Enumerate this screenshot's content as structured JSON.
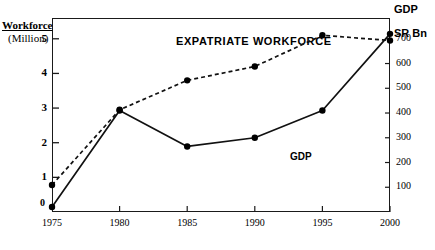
{
  "chart_data": {
    "type": "line",
    "title": "",
    "xlabel": "",
    "x": [
      1975,
      1980,
      1985,
      1990,
      1995,
      2000
    ],
    "categories": [
      "1975",
      "1980",
      "1985",
      "1990",
      "1995",
      "2000"
    ],
    "xlim": [
      1975,
      2000
    ],
    "grid": false,
    "legend_position": "inline-annotation",
    "axes": {
      "left": {
        "title": "Workforce",
        "unit": "(Million)",
        "ticks": [
          1,
          2,
          3,
          4,
          5
        ],
        "tick_labels": [
          "1",
          "2",
          "3",
          "4",
          "5"
        ],
        "zero_label": "0",
        "lim": [
          0,
          5.6
        ]
      },
      "right": {
        "title": "GDP",
        "unit": "SR Bn",
        "ticks": [
          100,
          200,
          300,
          400,
          500,
          600,
          700
        ],
        "tick_labels": [
          "100",
          "200",
          "300",
          "400",
          "500",
          "600",
          "700"
        ],
        "lim": [
          0,
          784
        ]
      }
    },
    "series": [
      {
        "name": "EXPATRIATE WORKFORCE",
        "axis": "left",
        "style": "dashed",
        "marker": "filled-circle",
        "values": [
          0.78,
          2.95,
          3.8,
          4.2,
          5.1,
          4.95
        ]
      },
      {
        "name": "GDP",
        "axis": "right",
        "style": "solid",
        "marker": "filled-circle",
        "values": [
          20,
          410,
          265,
          300,
          410,
          720
        ]
      }
    ],
    "annotations": [
      {
        "text": "EXPATRIATE WORKFORCE",
        "series": "EXPATRIATE WORKFORCE"
      },
      {
        "text": "GDP",
        "series": "GDP"
      }
    ],
    "colors": {
      "line": "#111111",
      "marker": "#000000",
      "frame": "#1a1a1a",
      "background": "#ffffff"
    }
  }
}
